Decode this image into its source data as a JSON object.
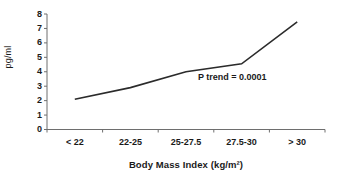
{
  "chart_data": {
    "type": "line",
    "title": "",
    "xlabel": "Body Mass Index (kg/m²)",
    "ylabel": "pg/ml",
    "categories": [
      "< 22",
      "22-25",
      "25-27.5",
      "27.5-30",
      "> 30"
    ],
    "values": [
      2.1,
      2.9,
      4.0,
      4.55,
      7.45
    ],
    "series": [
      {
        "name": "",
        "values": [
          2.1,
          2.9,
          4.0,
          4.55,
          7.45
        ]
      }
    ],
    "ylim": [
      0,
      8
    ],
    "yticks": [
      "0",
      "1",
      "2",
      "3",
      "4",
      "5",
      "6",
      "7",
      "8"
    ],
    "grid": false,
    "legend": "none",
    "markers": false,
    "line_color": "#2b2b2b",
    "axis_color": "#6e6e6e",
    "annotations": [
      {
        "text": "P trend = 0.0001",
        "x_category": "27.5-30",
        "y_value": 4.0
      }
    ]
  },
  "labels": {
    "annotation_p_trend": "P trend = 0.0001"
  }
}
